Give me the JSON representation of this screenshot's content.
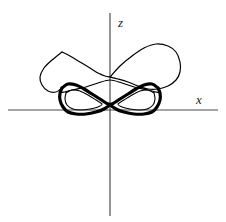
{
  "figure": {
    "title": "",
    "background_color": "#ffffff",
    "width": 226,
    "height": 222,
    "axis_color": "#4d4d4d",
    "curve_color": "#000000"
  },
  "axes": {
    "vertical": {
      "label": "z",
      "name": "z-axis",
      "x": 110,
      "y_top": 13,
      "y_bottom": 216,
      "label_x": 118,
      "label_y": 27
    },
    "horizontal": {
      "label": "x",
      "name": "x-axis",
      "y": 110,
      "x_left": 8,
      "x_right": 218,
      "label_x": 196,
      "label_y": 104
    },
    "origin": {
      "x": 110,
      "y": 110
    }
  },
  "chart_data": {
    "type": "line",
    "title": "",
    "xlabel": "x",
    "ylabel": "z",
    "grid": false,
    "legend": null,
    "xlim": [
      -110,
      108
    ],
    "ylim": [
      -106,
      97
    ],
    "series": [
      {
        "name": "left-lobe-outer",
        "stroke_width": 3.2,
        "closed": true,
        "points": [
          [
            -48,
            22
          ],
          [
            -42,
            26
          ],
          [
            -34,
            25
          ],
          [
            -26,
            21
          ],
          [
            -18,
            16
          ],
          [
            -10,
            11
          ],
          [
            -4,
            7
          ],
          [
            -1,
            5
          ],
          [
            -6,
            1
          ],
          [
            -14,
            -2
          ],
          [
            -24,
            -4
          ],
          [
            -34,
            -4
          ],
          [
            -42,
            -2
          ],
          [
            -47,
            3
          ],
          [
            -50,
            10
          ],
          [
            -50,
            17
          ],
          [
            -48,
            22
          ]
        ]
      },
      {
        "name": "left-lobe-inner",
        "stroke_width": 1.1,
        "closed": true,
        "points": [
          [
            -44,
            17
          ],
          [
            -38,
            20
          ],
          [
            -30,
            19
          ],
          [
            -22,
            15
          ],
          [
            -14,
            10
          ],
          [
            -8,
            6
          ],
          [
            -12,
            3
          ],
          [
            -20,
            1
          ],
          [
            -29,
            0
          ],
          [
            -37,
            1
          ],
          [
            -43,
            5
          ],
          [
            -45,
            11
          ],
          [
            -44,
            17
          ]
        ]
      },
      {
        "name": "right-lobe-outer",
        "stroke_width": 3.2,
        "closed": true,
        "points": [
          [
            48,
            22
          ],
          [
            42,
            26
          ],
          [
            34,
            25
          ],
          [
            26,
            21
          ],
          [
            18,
            16
          ],
          [
            10,
            11
          ],
          [
            4,
            7
          ],
          [
            1,
            5
          ],
          [
            6,
            1
          ],
          [
            14,
            -2
          ],
          [
            24,
            -4
          ],
          [
            34,
            -4
          ],
          [
            42,
            -2
          ],
          [
            47,
            3
          ],
          [
            50,
            10
          ],
          [
            50,
            17
          ],
          [
            48,
            22
          ]
        ]
      },
      {
        "name": "right-lobe-inner",
        "stroke_width": 1.1,
        "closed": true,
        "points": [
          [
            44,
            17
          ],
          [
            38,
            20
          ],
          [
            30,
            19
          ],
          [
            22,
            15
          ],
          [
            14,
            10
          ],
          [
            8,
            6
          ],
          [
            12,
            3
          ],
          [
            20,
            1
          ],
          [
            29,
            0
          ],
          [
            37,
            1
          ],
          [
            43,
            5
          ],
          [
            45,
            11
          ],
          [
            44,
            17
          ]
        ]
      },
      {
        "name": "upper-right-thin-loop",
        "stroke_width": 1.2,
        "closed": false,
        "points": [
          [
            0,
            33
          ],
          [
            10,
            44
          ],
          [
            22,
            54
          ],
          [
            34,
            62
          ],
          [
            46,
            66
          ],
          [
            58,
            64
          ],
          [
            66,
            58
          ],
          [
            70,
            48
          ],
          [
            70,
            38
          ],
          [
            66,
            30
          ],
          [
            58,
            24
          ],
          [
            48,
            21
          ],
          [
            38,
            21
          ],
          [
            28,
            24
          ],
          [
            18,
            28
          ],
          [
            8,
            31
          ],
          [
            0,
            33
          ]
        ]
      },
      {
        "name": "upper-left-thin-tail",
        "stroke_width": 1.2,
        "closed": false,
        "points": [
          [
            -48,
            58
          ],
          [
            -40,
            54
          ],
          [
            -30,
            48
          ],
          [
            -20,
            42
          ],
          [
            -12,
            37
          ],
          [
            -5,
            34
          ],
          [
            0,
            33
          ]
        ]
      },
      {
        "name": "left-sweep-thin",
        "stroke_width": 1.2,
        "closed": false,
        "points": [
          [
            -48,
            58
          ],
          [
            -58,
            50
          ],
          [
            -66,
            42
          ],
          [
            -70,
            33
          ],
          [
            -68,
            25
          ],
          [
            -62,
            19
          ],
          [
            -54,
            18
          ],
          [
            -48,
            22
          ]
        ]
      },
      {
        "name": "center-crossing-thin",
        "stroke_width": 1.2,
        "closed": false,
        "points": [
          [
            -50,
            17
          ],
          [
            -38,
            20
          ],
          [
            -24,
            23
          ],
          [
            -12,
            27
          ],
          [
            0,
            30
          ],
          [
            12,
            27
          ],
          [
            24,
            23
          ],
          [
            38,
            20
          ],
          [
            50,
            17
          ]
        ]
      }
    ]
  }
}
